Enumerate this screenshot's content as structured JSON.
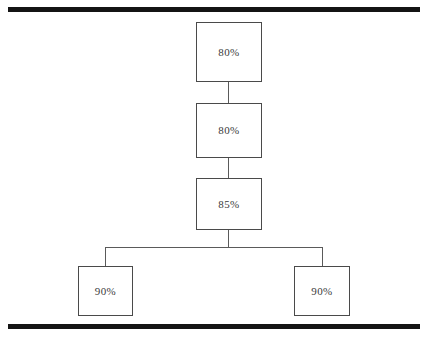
{
  "diagram": {
    "rules": {
      "top_label": "top-divider-rule",
      "bottom_label": "bottom-divider-rule"
    },
    "nodes": [
      {
        "id": "node-0",
        "label": "80%",
        "level": 0,
        "role": "root"
      },
      {
        "id": "node-1",
        "label": "80%",
        "level": 1,
        "role": "intermediate"
      },
      {
        "id": "node-2",
        "label": "85%",
        "level": 2,
        "role": "branch-parent"
      },
      {
        "id": "node-3",
        "label": "90%",
        "level": 3,
        "role": "leaf-left"
      },
      {
        "id": "node-4",
        "label": "90%",
        "level": 3,
        "role": "leaf-right"
      }
    ],
    "edges": [
      {
        "id": "conn-0-1",
        "from": "node-0",
        "to": "node-1",
        "kind": "vertical"
      },
      {
        "id": "conn-1-2",
        "from": "node-1",
        "to": "node-2",
        "kind": "vertical"
      },
      {
        "id": "conn-2-bus",
        "from": "node-2",
        "to": "bus",
        "kind": "vertical"
      },
      {
        "id": "conn-bus",
        "from": "bus",
        "to": "bus",
        "kind": "horizontal"
      },
      {
        "id": "conn-bus-left",
        "from": "bus",
        "to": "node-3",
        "kind": "vertical"
      },
      {
        "id": "conn-bus-right",
        "from": "bus",
        "to": "node-4",
        "kind": "vertical"
      }
    ],
    "colors": {
      "rule": "#141414",
      "box_border": "#4a4a4a",
      "connector": "#5a5a5a",
      "text": "#3a3a3a",
      "background": "#ffffff"
    }
  },
  "chart_data": {
    "type": "diagram",
    "title": "",
    "categories": [
      "node-0",
      "node-1",
      "node-2",
      "node-3",
      "node-4"
    ],
    "values": [
      80,
      80,
      85,
      90,
      90
    ],
    "labels": [
      "80%",
      "80%",
      "85%",
      "90%",
      "90%"
    ],
    "unit": "%",
    "structure": "tree",
    "depth": 4,
    "branching": {
      "parent": "node-2",
      "children": [
        "node-3",
        "node-4"
      ]
    }
  }
}
